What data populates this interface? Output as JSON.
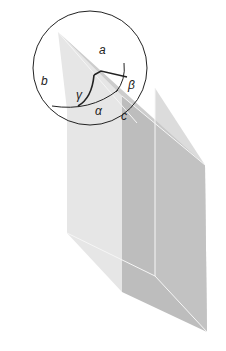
{
  "figure": {
    "labels": {
      "a": "a",
      "b": "b",
      "c": "c",
      "alpha": "α",
      "beta": "β",
      "gamma": "γ"
    },
    "colors": {
      "left_face": "#e6e6e6",
      "top_face": "#c9c9c9",
      "right_face": "#bdbdbd",
      "far_face": "#c6c6c6",
      "edge_highlight": "#f4f4f4",
      "outline": "#222222"
    }
  }
}
